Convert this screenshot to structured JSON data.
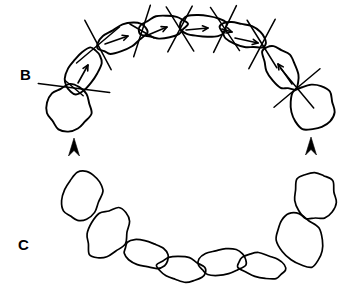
{
  "figure": {
    "background_color": "#ffffff",
    "ink_color": "#000000",
    "width": 357,
    "height": 295
  },
  "panels": [
    {
      "id": "B",
      "label": "B",
      "label_x": 20,
      "label_y": 80,
      "segment_count": 9,
      "has_direction_arrows": true,
      "direction_arrow_count": 7,
      "has_cross_lines": true,
      "cross_line_count": 7,
      "marker_count": 2
    },
    {
      "id": "C",
      "label": "C",
      "label_x": 18,
      "label_y": 250,
      "segment_count": 9,
      "has_direction_arrows": false,
      "has_cross_lines": false,
      "marker_count": 0
    }
  ],
  "panel_b": {
    "label": "B",
    "segments": [
      {
        "name": "terminal-left-bulb",
        "cx": 69,
        "cy": 108,
        "rx": 22,
        "ry": 23,
        "rot": 14
      },
      {
        "name": "segment-left-2",
        "cx": 83,
        "cy": 71,
        "rx": 25,
        "ry": 14,
        "rot": -58
      },
      {
        "name": "segment-left-3",
        "cx": 122,
        "cy": 38,
        "rx": 26,
        "ry": 12,
        "rot": -24
      },
      {
        "name": "segment-left-4",
        "cx": 163,
        "cy": 27,
        "rx": 24,
        "ry": 11,
        "rot": -7
      },
      {
        "name": "segment-center-5",
        "cx": 203,
        "cy": 26,
        "rx": 24,
        "ry": 11,
        "rot": 4
      },
      {
        "name": "segment-right-6",
        "cx": 243,
        "cy": 35,
        "rx": 24,
        "ry": 11,
        "rot": 19
      },
      {
        "name": "segment-right-7",
        "cx": 281,
        "cy": 68,
        "rx": 25,
        "ry": 14,
        "rot": 56
      },
      {
        "name": "terminal-right-bulb",
        "cx": 312,
        "cy": 107,
        "rx": 22,
        "ry": 23,
        "rot": -14
      }
    ],
    "cross_lines": [
      {
        "name": "cross-line-1",
        "cx": 74,
        "cy": 88,
        "angle_a": 7,
        "angle_b": 40,
        "len_a": 36,
        "len_b": 12
      },
      {
        "name": "cross-line-2",
        "cx": 98,
        "cy": 45,
        "angle_a": -40,
        "angle_b": 62,
        "len_a": 28,
        "len_b": 28
      },
      {
        "name": "cross-line-3",
        "cx": 142,
        "cy": 31,
        "angle_a": -72,
        "angle_b": 30,
        "len_a": 27,
        "len_b": 14
      },
      {
        "name": "cross-line-4",
        "cx": 180,
        "cy": 29,
        "angle_a": -62,
        "angle_b": 58,
        "len_a": 26,
        "len_b": 26
      },
      {
        "name": "cross-line-5",
        "cx": 225,
        "cy": 29,
        "angle_a": -64,
        "angle_b": 56,
        "len_a": 26,
        "len_b": 26
      },
      {
        "name": "cross-line-6",
        "cx": 262,
        "cy": 44,
        "angle_a": -62,
        "angle_b": 58,
        "len_a": 28,
        "len_b": 28
      },
      {
        "name": "cross-line-7",
        "cx": 297,
        "cy": 88,
        "angle_a": -40,
        "angle_b": 50,
        "len_a": 30,
        "len_b": 26
      }
    ],
    "direction_arrows": [
      {
        "name": "direction-arrow-1",
        "x1": 78,
        "y1": 83,
        "x2": 88,
        "y2": 65
      },
      {
        "name": "direction-arrow-2",
        "x1": 105,
        "y1": 44,
        "x2": 128,
        "y2": 36
      },
      {
        "name": "direction-arrow-3",
        "x1": 148,
        "y1": 35,
        "x2": 167,
        "y2": 27
      },
      {
        "name": "direction-arrow-4",
        "x1": 186,
        "y1": 30,
        "x2": 208,
        "y2": 28
      },
      {
        "name": "direction-arrow-5",
        "x1": 222,
        "y1": 29,
        "x2": 232,
        "y2": 32
      },
      {
        "name": "direction-arrow-6",
        "x1": 235,
        "y1": 38,
        "x2": 258,
        "y2": 43
      },
      {
        "name": "direction-arrow-7",
        "x1": 292,
        "y1": 84,
        "x2": 278,
        "y2": 64
      }
    ],
    "markers": [
      {
        "name": "arrowhead-marker-left",
        "x": 74,
        "y": 138,
        "direction": "up"
      },
      {
        "name": "arrowhead-marker-right",
        "x": 311,
        "y": 137,
        "direction": "up"
      }
    ]
  },
  "panel_c": {
    "label": "C",
    "segments": [
      {
        "name": "terminal-left-oval",
        "cx": 82,
        "cy": 196,
        "rx": 19,
        "ry": 25,
        "rot": 20
      },
      {
        "name": "segment-left-2",
        "cx": 108,
        "cy": 233,
        "rx": 19,
        "ry": 27,
        "rot": 32
      },
      {
        "name": "segment-left-3",
        "cx": 146,
        "cy": 254,
        "rx": 23,
        "ry": 13,
        "rot": 17
      },
      {
        "name": "segment-left-4",
        "cx": 182,
        "cy": 269,
        "rx": 24,
        "ry": 12,
        "rot": 9
      },
      {
        "name": "segment-center-5",
        "cx": 222,
        "cy": 262,
        "rx": 24,
        "ry": 13,
        "rot": -7
      },
      {
        "name": "segment-right-6",
        "cx": 262,
        "cy": 266,
        "rx": 24,
        "ry": 12,
        "rot": 10
      },
      {
        "name": "segment-right-7",
        "cx": 300,
        "cy": 240,
        "rx": 21,
        "ry": 28,
        "rot": -33
      },
      {
        "name": "terminal-right-oval",
        "cx": 315,
        "cy": 196,
        "rx": 21,
        "ry": 24,
        "rot": -12
      }
    ]
  }
}
